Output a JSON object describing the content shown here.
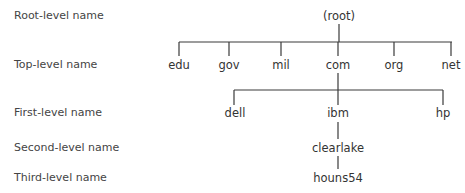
{
  "levels": [
    {
      "label": "Root-level name",
      "y": 9
    },
    {
      "label": "Top-level name",
      "y": 58
    },
    {
      "label": "First-level name",
      "y": 106
    },
    {
      "label": "Second-level name",
      "y": 141
    },
    {
      "label": "Third-level name",
      "y": 171
    }
  ],
  "nodes": {
    "root": {
      "label": "(root)",
      "x": 339,
      "y": 9
    },
    "edu": {
      "label": "edu",
      "x": 179,
      "y": 58
    },
    "gov": {
      "label": "gov",
      "x": 229,
      "y": 58
    },
    "mil": {
      "label": "mil",
      "x": 281,
      "y": 58
    },
    "com": {
      "label": "com",
      "x": 338,
      "y": 58
    },
    "org": {
      "label": "org",
      "x": 394,
      "y": 58
    },
    "net": {
      "label": "net",
      "x": 451,
      "y": 58
    },
    "dell": {
      "label": "dell",
      "x": 235,
      "y": 106
    },
    "ibm": {
      "label": "ibm",
      "x": 338,
      "y": 106
    },
    "hp": {
      "label": "hp",
      "x": 443,
      "y": 106
    },
    "clearlake": {
      "label": "clearlake",
      "x": 338,
      "y": 141
    },
    "houns54": {
      "label": "houns54",
      "x": 338,
      "y": 171
    }
  },
  "line_color": "#3a3a3a"
}
